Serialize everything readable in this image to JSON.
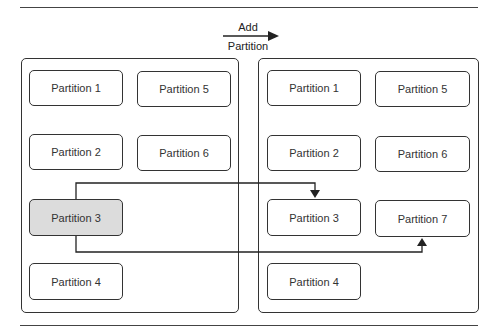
{
  "header": {
    "action_label_line1": "Add",
    "action_label_line2": "Partition"
  },
  "before": {
    "partitions": [
      {
        "label": "Partition 1"
      },
      {
        "label": "Partition 5"
      },
      {
        "label": "Partition 2"
      },
      {
        "label": "Partition 6"
      },
      {
        "label": "Partition 3",
        "highlighted": true
      },
      {
        "label": "Partition 4"
      }
    ]
  },
  "after": {
    "partitions": [
      {
        "label": "Partition 1"
      },
      {
        "label": "Partition 5"
      },
      {
        "label": "Partition 2"
      },
      {
        "label": "Partition 6"
      },
      {
        "label": "Partition 3"
      },
      {
        "label": "Partition 7"
      },
      {
        "label": "Partition 4"
      }
    ]
  },
  "colors": {
    "line": "#333333",
    "highlight_fill": "#dcdcdc",
    "background": "#ffffff"
  }
}
